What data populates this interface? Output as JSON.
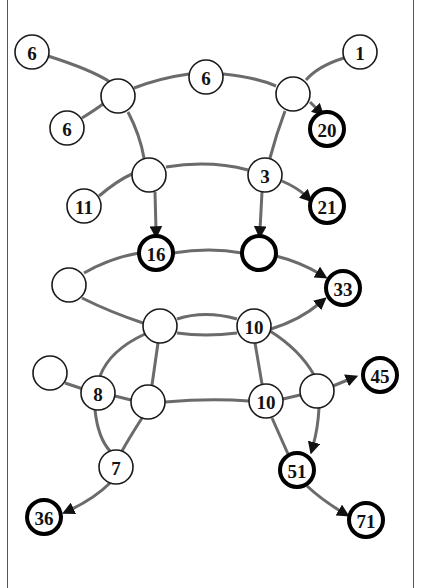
{
  "diagram": {
    "type": "graph",
    "colors": {
      "edge": "#6b6b6b",
      "node_stroke": "#1a1a1a",
      "node_fill": "#ffffff",
      "text": "#111111",
      "frame": "#555555"
    },
    "nodes": [
      {
        "id": "A",
        "label": "6",
        "x": 32,
        "y": 52,
        "bold": false
      },
      {
        "id": "B",
        "label": "6",
        "x": 67,
        "y": 128,
        "bold": false
      },
      {
        "id": "C",
        "label": "",
        "x": 118,
        "y": 96,
        "bold": false
      },
      {
        "id": "D",
        "label": "6",
        "x": 206,
        "y": 77,
        "bold": false
      },
      {
        "id": "E",
        "label": "",
        "x": 293,
        "y": 94,
        "bold": false
      },
      {
        "id": "F",
        "label": "1",
        "x": 360,
        "y": 52,
        "bold": false
      },
      {
        "id": "G",
        "label": "20",
        "x": 327,
        "y": 129,
        "bold": true
      },
      {
        "id": "H",
        "label": "",
        "x": 149,
        "y": 175,
        "bold": false
      },
      {
        "id": "I",
        "label": "11",
        "x": 84,
        "y": 206,
        "bold": false
      },
      {
        "id": "J",
        "label": "3",
        "x": 265,
        "y": 175,
        "bold": false
      },
      {
        "id": "K",
        "label": "21",
        "x": 327,
        "y": 206,
        "bold": true
      },
      {
        "id": "L",
        "label": "16",
        "x": 156,
        "y": 253,
        "bold": true
      },
      {
        "id": "M",
        "label": "",
        "x": 259,
        "y": 253,
        "bold": true
      },
      {
        "id": "N",
        "label": "",
        "x": 69,
        "y": 285,
        "bold": false
      },
      {
        "id": "O",
        "label": "33",
        "x": 343,
        "y": 288,
        "bold": true
      },
      {
        "id": "P",
        "label": "",
        "x": 160,
        "y": 326,
        "bold": false
      },
      {
        "id": "Q",
        "label": "10",
        "x": 254,
        "y": 326,
        "bold": false
      },
      {
        "id": "R",
        "label": "",
        "x": 50,
        "y": 373,
        "bold": false
      },
      {
        "id": "S",
        "label": "8",
        "x": 98,
        "y": 393,
        "bold": false
      },
      {
        "id": "T",
        "label": "",
        "x": 148,
        "y": 402,
        "bold": false
      },
      {
        "id": "U",
        "label": "10",
        "x": 266,
        "y": 401,
        "bold": false
      },
      {
        "id": "V",
        "label": "",
        "x": 317,
        "y": 391,
        "bold": false
      },
      {
        "id": "W",
        "label": "45",
        "x": 380,
        "y": 375,
        "bold": true
      },
      {
        "id": "X",
        "label": "7",
        "x": 116,
        "y": 467,
        "bold": false
      },
      {
        "id": "Y",
        "label": "36",
        "x": 44,
        "y": 517,
        "bold": true
      },
      {
        "id": "Z",
        "label": "51",
        "x": 297,
        "y": 470,
        "bold": true
      },
      {
        "id": "AA",
        "label": "71",
        "x": 366,
        "y": 520,
        "bold": true
      }
    ],
    "edges": [
      {
        "from": "A",
        "to": "C",
        "d": "M48,56 Q92,70 110,82",
        "arrow": false
      },
      {
        "from": "B",
        "to": "C",
        "d": "M82,118 Q95,110 103,104",
        "arrow": false
      },
      {
        "from": "C",
        "to": "D",
        "d": "M134,88 Q160,78 189,74",
        "arrow": false
      },
      {
        "from": "D",
        "to": "E",
        "d": "M223,74 Q255,77 276,86",
        "arrow": false
      },
      {
        "from": "F",
        "to": "E",
        "d": "M344,58 Q318,66 306,80",
        "arrow": false
      },
      {
        "from": "E",
        "to": "G",
        "d": "M310,102 L318,110",
        "arrow": true
      },
      {
        "from": "C",
        "to": "H",
        "d": "M128,112 Q140,135 144,158",
        "arrow": false
      },
      {
        "from": "E",
        "to": "J",
        "d": "M285,111 Q276,135 270,158",
        "arrow": false
      },
      {
        "from": "I",
        "to": "H",
        "d": "M99,196 Q118,180 132,174",
        "arrow": false
      },
      {
        "from": "H",
        "to": "J",
        "d": "M166,167 Q210,160 248,170",
        "arrow": false
      },
      {
        "from": "J",
        "to": "K",
        "d": "M282,181 Q298,188 306,196",
        "arrow": true
      },
      {
        "from": "H",
        "to": "L",
        "d": "M155,192 L156,230",
        "arrow": true
      },
      {
        "from": "J",
        "to": "M",
        "d": "M262,192 L260,230",
        "arrow": true
      },
      {
        "from": "N",
        "to": "L",
        "d": "M84,273 Q110,258 139,253",
        "arrow": false
      },
      {
        "from": "L",
        "to": "M",
        "d": "M173,253 Q210,247 242,253",
        "arrow": false
      },
      {
        "from": "M",
        "to": "O",
        "d": "M276,256 Q300,262 320,274",
        "arrow": true
      },
      {
        "from": "N",
        "to": "P",
        "d": "M82,298 Q110,312 143,323",
        "arrow": false
      },
      {
        "from": "P",
        "to": "Q",
        "d": "M177,319 Q205,310 237,319",
        "arrow": false
      },
      {
        "from": "P",
        "to": "Q",
        "d": "M177,333 Q205,337 237,333",
        "arrow": false
      },
      {
        "from": "Q",
        "to": "O",
        "d": "M271,329 Q300,320 320,303",
        "arrow": true
      },
      {
        "from": "P",
        "to": "S",
        "d": "M145,334 Q110,350 100,376",
        "arrow": false
      },
      {
        "from": "P",
        "to": "T",
        "d": "M158,343 L152,385",
        "arrow": false
      },
      {
        "from": "Q",
        "to": "U",
        "d": "M255,343 L262,384",
        "arrow": false
      },
      {
        "from": "Q",
        "to": "V",
        "d": "M270,331 Q300,350 314,375",
        "arrow": false
      },
      {
        "from": "R",
        "to": "S",
        "d": "M65,383 L83,389",
        "arrow": false
      },
      {
        "from": "S",
        "to": "T",
        "d": "M115,396 L131,400",
        "arrow": false
      },
      {
        "from": "T",
        "to": "U",
        "d": "M165,402 Q210,398 249,401",
        "arrow": false
      },
      {
        "from": "U",
        "to": "V",
        "d": "M283,399 L300,395",
        "arrow": false
      },
      {
        "from": "V",
        "to": "W",
        "d": "M333,386 L350,379",
        "arrow": true
      },
      {
        "from": "S",
        "to": "X",
        "d": "M95,410 Q98,438 110,451",
        "arrow": false
      },
      {
        "from": "T",
        "to": "X",
        "d": "M142,418 Q128,440 122,451",
        "arrow": false
      },
      {
        "from": "X",
        "to": "Y",
        "d": "M110,483 Q95,498 70,510",
        "arrow": true
      },
      {
        "from": "U",
        "to": "Z",
        "d": "M272,418 L288,454",
        "arrow": false
      },
      {
        "from": "V",
        "to": "Z",
        "d": "M319,408 Q318,428 313,446",
        "arrow": true
      },
      {
        "from": "Z",
        "to": "AA",
        "d": "M307,486 Q322,500 342,512",
        "arrow": true
      }
    ]
  }
}
